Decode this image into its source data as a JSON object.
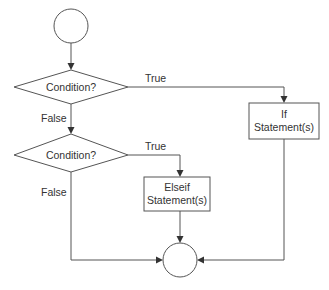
{
  "diagram": {
    "type": "flowchart",
    "nodes": {
      "start": {
        "shape": "circle",
        "label": ""
      },
      "condition1": {
        "shape": "diamond",
        "label": "Condition?"
      },
      "condition2": {
        "shape": "diamond",
        "label": "Condition?"
      },
      "if_block": {
        "shape": "rectangle",
        "label_line1": "If",
        "label_line2": "Statement(s)"
      },
      "elseif_block": {
        "shape": "rectangle",
        "label_line1": "Elseif",
        "label_line2": "Statement(s)"
      },
      "end": {
        "shape": "circle",
        "label": ""
      }
    },
    "edges": {
      "start_to_condition1": {
        "label": ""
      },
      "condition1_true": {
        "label": "True"
      },
      "condition1_false": {
        "label": "False"
      },
      "condition2_true": {
        "label": "True"
      },
      "condition2_false": {
        "label": "False"
      },
      "if_to_end": {
        "label": ""
      },
      "elseif_to_end": {
        "label": ""
      }
    },
    "colors": {
      "stroke": "#555555",
      "text": "#333333",
      "background": "#ffffff"
    }
  }
}
